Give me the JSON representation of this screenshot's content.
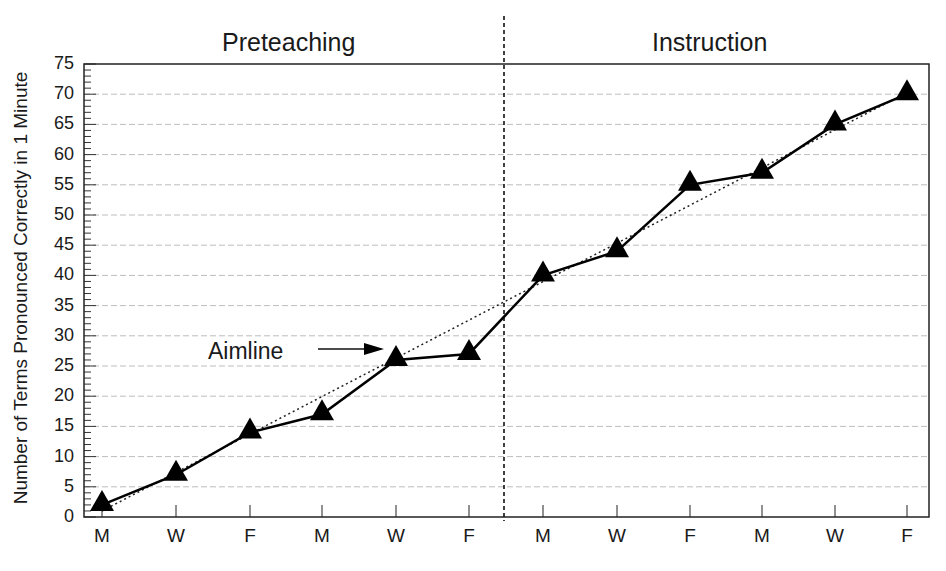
{
  "chart_data": {
    "type": "line",
    "title": "",
    "xlabel": "",
    "ylabel": "Number of Terms Pronounced Correctly in 1 Minute",
    "ylim": [
      0,
      75
    ],
    "yticks": [
      0,
      5,
      10,
      15,
      20,
      25,
      30,
      35,
      40,
      45,
      50,
      55,
      60,
      65,
      70,
      75
    ],
    "grid": true,
    "categories": [
      "M",
      "W",
      "F",
      "M",
      "W",
      "F",
      "M",
      "W",
      "F",
      "M",
      "W",
      "F"
    ],
    "phases": [
      {
        "label": "Preteaching",
        "start_index": 0,
        "end_index": 5
      },
      {
        "label": "Instruction",
        "start_index": 6,
        "end_index": 11
      }
    ],
    "series": [
      {
        "name": "Terms Pronounced Correctly",
        "marker": "triangle",
        "line": "solid",
        "values": [
          2,
          7,
          14,
          17,
          26,
          27,
          40,
          44,
          55,
          57,
          65,
          70
        ]
      },
      {
        "name": "Aimline",
        "line": "dotted",
        "values": [
          1,
          7.3,
          13.6,
          19.9,
          26.2,
          32.5,
          38.8,
          45.1,
          51.4,
          57.7,
          64,
          70.3
        ]
      }
    ],
    "annotations": [
      {
        "text": "Aimline",
        "arrow_to_index": 4
      }
    ],
    "phase_divider_between": [
      5,
      6
    ]
  },
  "labels": {
    "phase_left": "Preteaching",
    "phase_right": "Instruction",
    "ylabel": "Number of Terms Pronounced Correctly in 1 Minute",
    "aimline": "Aimline"
  }
}
